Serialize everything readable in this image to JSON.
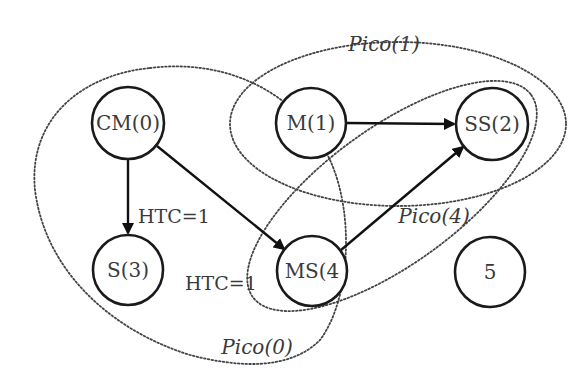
{
  "diagram": {
    "type": "piconet-graph",
    "nodes": [
      {
        "id": "CM0",
        "label": "CM(0)",
        "cx": 128,
        "cy": 123,
        "r": 36
      },
      {
        "id": "M1",
        "label": "M(1)",
        "cx": 311,
        "cy": 123,
        "r": 35
      },
      {
        "id": "SS2",
        "label": "SS(2)",
        "cx": 492,
        "cy": 124,
        "r": 36
      },
      {
        "id": "S3",
        "label": "S(3)",
        "cx": 128,
        "cy": 270,
        "r": 35
      },
      {
        "id": "MS4",
        "label": "MS(4",
        "cx": 312,
        "cy": 271,
        "r": 35
      },
      {
        "id": "N5",
        "label": "5",
        "cx": 490,
        "cy": 272,
        "r": 35
      }
    ],
    "edges": [
      {
        "from": "CM0",
        "to": "S3",
        "label": "HTC=1"
      },
      {
        "from": "CM0",
        "to": "MS4",
        "label": "HTC=1"
      },
      {
        "from": "M1",
        "to": "SS2",
        "label": ""
      },
      {
        "from": "MS4",
        "to": "SS2",
        "label": ""
      }
    ],
    "edge_labels": [
      {
        "text": "HTC=1",
        "x": 138,
        "y": 216
      },
      {
        "text": "HTC=1",
        "x": 185,
        "y": 283
      }
    ],
    "piconets": [
      {
        "id": "pico0",
        "label": "Pico(0)",
        "label_x": 257,
        "label_y": 347,
        "members": [
          "CM0",
          "S3",
          "MS4"
        ]
      },
      {
        "id": "pico1",
        "label": "Pico(1)",
        "label_x": 384,
        "label_y": 44,
        "members": [
          "M1",
          "SS2"
        ]
      },
      {
        "id": "pico4",
        "label": "Pico(4)",
        "label_x": 434,
        "label_y": 216,
        "members": [
          "MS4",
          "SS2"
        ]
      }
    ],
    "colors": {
      "node_stroke": "#1a1a1a",
      "text": "#3a3a3a",
      "edge": "#111111",
      "dotted": "#444444",
      "background": "#ffffff"
    }
  }
}
